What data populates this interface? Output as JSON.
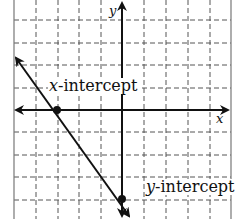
{
  "diagram": {
    "type": "coordinate-plane-linear-graph",
    "axes": {
      "x_label": "x",
      "y_label": "y"
    },
    "grid": {
      "x_range": [
        -5,
        5
      ],
      "y_range": [
        -5,
        5
      ],
      "step": 1,
      "style": "dashed"
    },
    "line": {
      "slope": -1.3333,
      "x_intercept": -3,
      "y_intercept": -4
    },
    "points": [
      {
        "name": "x-intercept",
        "x": -3,
        "y": 0
      },
      {
        "name": "y-intercept",
        "x": 0,
        "y": -4
      }
    ],
    "annotations": {
      "x_intercept": {
        "var": "x",
        "text": "-intercept"
      },
      "y_intercept": {
        "var": "y",
        "text": "-intercept"
      }
    },
    "colors": {
      "ink": "#111111",
      "grid": "#555555",
      "border": "#777777"
    }
  }
}
